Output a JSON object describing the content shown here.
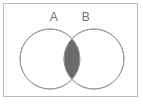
{
  "figure": {
    "width": 143,
    "height": 104,
    "background_color": "#ffffff",
    "frame": {
      "name": "outer-frame",
      "border_color": "#b9b9b9",
      "border_width": 1,
      "x": 3,
      "y": 3,
      "width": 135,
      "height": 94
    }
  },
  "chart_data": {
    "type": "venn",
    "title": "",
    "sets": [
      {
        "label": "A",
        "center_x": 50,
        "center_y": 59,
        "radius": 30,
        "fill": "#ffffff",
        "stroke": "#9a9a9a"
      },
      {
        "label": "B",
        "center_x": 94,
        "center_y": 59,
        "radius": 30,
        "fill": "#ffffff",
        "stroke": "#9a9a9a"
      }
    ],
    "regions": [
      {
        "name": "A only",
        "shaded": false,
        "fill": "#ffffff"
      },
      {
        "name": "B only",
        "shaded": false,
        "fill": "#ffffff"
      },
      {
        "name": "A intersect B",
        "shaded": true,
        "fill": "#6b6b6b"
      }
    ],
    "shaded_region": "A ∩ B",
    "legend": {
      "position": "none",
      "entries": []
    },
    "grid": false,
    "xlabel": "",
    "ylabel": ""
  },
  "labels": {
    "set_a": "A",
    "set_b": "B"
  },
  "colors": {
    "shade": "#6b6b6b",
    "circle_stroke": "#9a9a9a",
    "frame": "#b9b9b9",
    "label_text": "#6f6f6f",
    "background": "#ffffff"
  }
}
